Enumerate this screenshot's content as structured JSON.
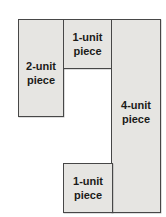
{
  "diagram": {
    "background_color": "#ffffff",
    "piece_fill_color": "#e6e5e2",
    "piece_border_color": "#474747",
    "text_color": "#1b1b19",
    "pieces": [
      {
        "id": "two-unit",
        "units": 2,
        "line1": "2-unit",
        "line2": "piece"
      },
      {
        "id": "one-unit-top",
        "units": 1,
        "line1": "1-unit",
        "line2": "piece"
      },
      {
        "id": "four-unit",
        "units": 4,
        "line1": "4-unit",
        "line2": "piece"
      },
      {
        "id": "one-unit-bottom",
        "units": 1,
        "line1": "1-unit",
        "line2": "piece"
      }
    ]
  }
}
